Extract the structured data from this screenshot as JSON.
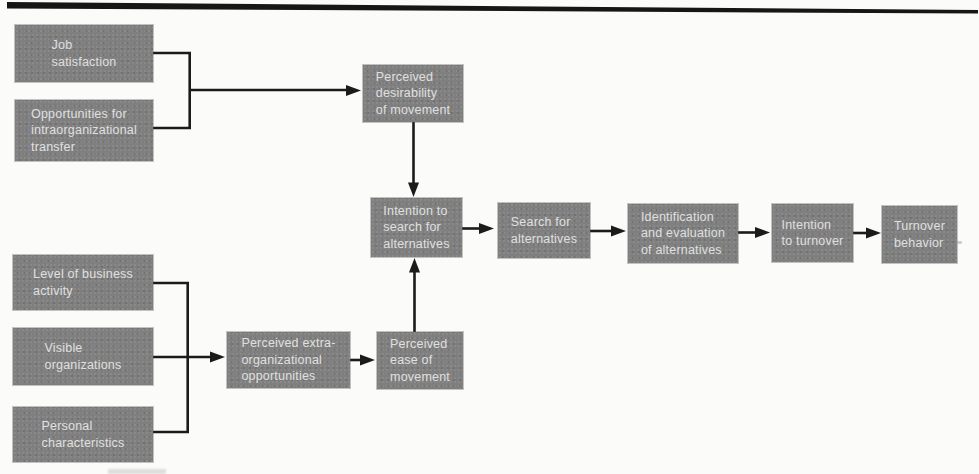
{
  "diagram": {
    "colors": {
      "box_fill": "#7f7f7f",
      "box_text": "#e0e0e0",
      "line": "#1b1b1b",
      "paper": "#fbfbf9"
    },
    "nodes": [
      {
        "id": "job-satisfaction",
        "label": "Job\nsatisfaction"
      },
      {
        "id": "opportunities-transfer",
        "label": "Opportunities for\nintraorganizational\ntransfer"
      },
      {
        "id": "perceived-desirability",
        "label": "Perceived\ndesirability\nof movement"
      },
      {
        "id": "intention-search",
        "label": "Intention to\nsearch for\nalternatives"
      },
      {
        "id": "search-alternatives",
        "label": "Search for\nalternatives"
      },
      {
        "id": "identification-evaluation",
        "label": "Identification\nand evaluation\nof alternatives"
      },
      {
        "id": "intention-turnover",
        "label": "Intention\nto turnover"
      },
      {
        "id": "turnover-behavior",
        "label": "Turnover\nbehavior"
      },
      {
        "id": "level-business",
        "label": "Level of business\nactivity"
      },
      {
        "id": "visible-organizations",
        "label": "Visible\norganizations"
      },
      {
        "id": "personal-characteristics",
        "label": "Personal\ncharacteristics"
      },
      {
        "id": "perceived-extra",
        "label": "Perceived extra-\norganizational\nopportunities"
      },
      {
        "id": "perceived-ease",
        "label": "Perceived\nease of\nmovement"
      }
    ],
    "edges": [
      {
        "from": [
          "job-satisfaction",
          "opportunities-transfer"
        ],
        "to": "perceived-desirability"
      },
      {
        "from": "perceived-desirability",
        "to": "intention-search"
      },
      {
        "from": [
          "level-business",
          "visible-organizations",
          "personal-characteristics"
        ],
        "to": "perceived-extra"
      },
      {
        "from": "perceived-extra",
        "to": "perceived-ease"
      },
      {
        "from": "perceived-ease",
        "to": "intention-search"
      },
      {
        "from": "intention-search",
        "to": "search-alternatives"
      },
      {
        "from": "search-alternatives",
        "to": "identification-evaluation"
      },
      {
        "from": "identification-evaluation",
        "to": "intention-turnover"
      },
      {
        "from": "intention-turnover",
        "to": "turnover-behavior"
      }
    ]
  }
}
